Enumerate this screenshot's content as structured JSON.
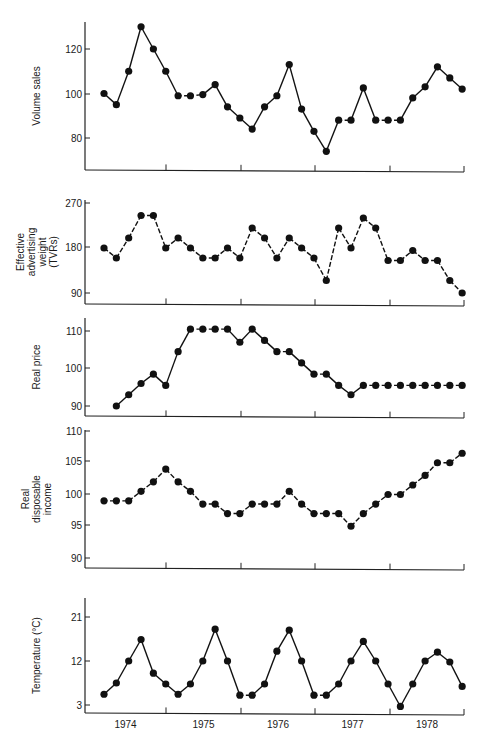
{
  "chart_data": [
    {
      "type": "line",
      "title": "",
      "xlabel": "",
      "ylabel": "Volume sales",
      "ylabel_lines": [
        "Volume sales"
      ],
      "yticks": [
        80,
        100,
        120
      ],
      "ylim": [
        68,
        133
      ],
      "grid": false,
      "x_start_index": 0,
      "values": [
        100,
        95,
        110,
        130,
        120,
        110,
        99,
        99,
        99.5,
        104,
        94,
        89,
        84,
        94,
        99,
        113,
        93,
        83,
        74,
        88,
        88,
        102.5,
        88,
        88,
        88,
        98,
        103,
        112,
        107,
        102
      ],
      "frame": {
        "top": 22,
        "bottom": 170,
        "tick_px": {
          "80": 138,
          "100": 94,
          "120": 49
        }
      }
    },
    {
      "type": "line",
      "title": "",
      "xlabel": "",
      "ylabel": "Effective advertising weight (TVRs)",
      "ylabel_lines": [
        "Effective",
        "advertising",
        "weight",
        "(TVRs)"
      ],
      "yticks": [
        90,
        180,
        270
      ],
      "ylim": [
        80,
        275
      ],
      "grid": false,
      "x_start_index": 0,
      "values": [
        180,
        160,
        200,
        245,
        245,
        180,
        200,
        180,
        160,
        160,
        180,
        160,
        220,
        200,
        160,
        200,
        180,
        160,
        115,
        220,
        180,
        240,
        220,
        155,
        155,
        175,
        155,
        155,
        115,
        90
      ],
      "frame": {
        "top": 200,
        "bottom": 304,
        "tick_px": {
          "90": 293,
          "180": 247,
          "270": 203
        }
      }
    },
    {
      "type": "line",
      "title": "",
      "xlabel": "",
      "ylabel": "Real price",
      "ylabel_lines": [
        "Real price"
      ],
      "yticks": [
        90,
        100,
        110
      ],
      "ylim": [
        88,
        113
      ],
      "grid": false,
      "x_start_index": 1,
      "values": [
        90,
        93,
        96,
        98.5,
        95.5,
        104.5,
        110.5,
        110.5,
        110.5,
        110.5,
        107,
        110.5,
        107.5,
        104.5,
        104.5,
        101.5,
        98.5,
        98.5,
        95.5,
        93,
        95.5,
        95.5,
        95.5,
        95.5,
        95.5,
        95.5,
        95.5,
        95.5,
        95.5
      ],
      "frame": {
        "top": 318,
        "bottom": 416,
        "tick_px": {
          "90": 406,
          "100": 368,
          "110": 331
        }
      }
    },
    {
      "type": "line",
      "title": "",
      "xlabel": "",
      "ylabel": "Real disposable income",
      "ylabel_lines": [
        "Real",
        "disposable",
        "income"
      ],
      "yticks": [
        90,
        95,
        100,
        105,
        110
      ],
      "ylim": [
        88,
        110
      ],
      "grid": false,
      "x_start_index": 0,
      "values": [
        99,
        99,
        99,
        100.5,
        102,
        104,
        102,
        100.5,
        98.5,
        98.5,
        97,
        97,
        98.5,
        98.5,
        98.5,
        100.5,
        98.5,
        97,
        97,
        97,
        95,
        97,
        98.5,
        100,
        100,
        101.5,
        103,
        105,
        105,
        106.5
      ],
      "frame": {
        "top": 430,
        "bottom": 568,
        "tick_px": {
          "90": 558,
          "95": 525,
          "100": 494,
          "105": 461,
          "110": 431
        }
      }
    },
    {
      "type": "line",
      "title": "",
      "xlabel": "",
      "ylabel": "Temperature (°C)",
      "ylabel_lines": [
        "Temperature (°C)"
      ],
      "yticks": [
        3,
        12,
        21
      ],
      "ylim": [
        1,
        24
      ],
      "grid": false,
      "x_start_index": 0,
      "values": [
        5.2,
        7.5,
        12,
        16.4,
        9.5,
        7.3,
        5.2,
        7.3,
        12,
        18.5,
        12,
        5,
        5,
        7.3,
        14,
        18.3,
        12,
        5,
        5,
        7.3,
        12,
        16,
        12,
        7.3,
        2.7,
        7.3,
        12,
        13.8,
        11.8,
        6.8
      ],
      "frame": {
        "top": 598,
        "bottom": 713,
        "tick_px": {
          "3": 705,
          "12": 661,
          "21": 617
        }
      }
    }
  ],
  "x_axis": {
    "categories": [
      "1974",
      "1975",
      "1976",
      "1977",
      "1978"
    ],
    "points_per_year": 6,
    "first_point_x": 104,
    "point_spacing": 12.35,
    "axis_left": 85,
    "axis_right": 464,
    "year_ticks_x": [
      166,
      241,
      315,
      390,
      464
    ]
  }
}
